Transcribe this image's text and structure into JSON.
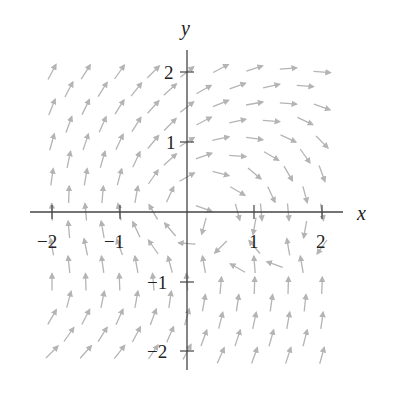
{
  "chart_data": {
    "type": "vector_field",
    "title": "",
    "xlabel": "x",
    "ylabel": "y",
    "xlim": [
      -2.3,
      2.3
    ],
    "ylim": [
      -2.3,
      2.3
    ],
    "grid": false,
    "x_ticks": [
      -2,
      -1,
      1,
      2
    ],
    "y_ticks": [
      -2,
      -1,
      1,
      2
    ],
    "x_tick_labels": [
      "−2",
      "−1",
      "1",
      "2"
    ],
    "y_tick_labels": [
      "−2",
      "−1",
      "1",
      "2"
    ],
    "arrow_color": "#b4b4b4",
    "axis_color": "#444444",
    "arrow_length_units": 0.24,
    "arrows_note": "each arrow: [x, y, direction_angle_degrees] (normalized direction field, staggered grid)",
    "arrows": [
      [
        -2.0,
        2.0,
        62
      ],
      [
        -1.5,
        2.0,
        58
      ],
      [
        -1.0,
        2.0,
        55
      ],
      [
        -0.5,
        2.0,
        45
      ],
      [
        0.0,
        2.0,
        38
      ],
      [
        -1.75,
        1.75,
        62
      ],
      [
        -1.25,
        1.75,
        58
      ],
      [
        -0.75,
        1.75,
        52
      ],
      [
        -0.25,
        1.75,
        42
      ],
      [
        0.25,
        1.75,
        30
      ],
      [
        0.75,
        1.8,
        20
      ],
      [
        1.25,
        1.8,
        12
      ],
      [
        1.75,
        1.8,
        -5
      ],
      [
        0.5,
        2.05,
        28
      ],
      [
        1.0,
        2.05,
        18
      ],
      [
        1.5,
        2.05,
        5
      ],
      [
        2.0,
        2.0,
        -5
      ],
      [
        -2.0,
        1.5,
        68
      ],
      [
        -1.5,
        1.5,
        64
      ],
      [
        -1.0,
        1.5,
        58
      ],
      [
        -0.5,
        1.5,
        48
      ],
      [
        0.0,
        1.5,
        38
      ],
      [
        0.5,
        1.55,
        22
      ],
      [
        1.0,
        1.55,
        10
      ],
      [
        1.5,
        1.55,
        -5
      ],
      [
        2.0,
        1.5,
        -20
      ],
      [
        -1.75,
        1.25,
        70
      ],
      [
        -1.25,
        1.25,
        66
      ],
      [
        -0.75,
        1.25,
        58
      ],
      [
        -0.25,
        1.25,
        45
      ],
      [
        0.25,
        1.3,
        28
      ],
      [
        0.75,
        1.3,
        12
      ],
      [
        1.25,
        1.3,
        -5
      ],
      [
        1.75,
        1.3,
        -25
      ],
      [
        -2.0,
        1.0,
        74
      ],
      [
        -1.5,
        1.0,
        72
      ],
      [
        -1.0,
        1.0,
        65
      ],
      [
        -0.5,
        1.0,
        50
      ],
      [
        0.0,
        1.0,
        32
      ],
      [
        0.5,
        1.05,
        12
      ],
      [
        1.0,
        1.05,
        -8
      ],
      [
        1.5,
        1.05,
        -25
      ],
      [
        2.0,
        1.0,
        -45
      ],
      [
        -1.75,
        0.75,
        78
      ],
      [
        -1.25,
        0.75,
        74
      ],
      [
        -0.75,
        0.75,
        65
      ],
      [
        -0.25,
        0.75,
        42
      ],
      [
        0.25,
        0.8,
        20
      ],
      [
        0.75,
        0.8,
        -5
      ],
      [
        1.25,
        0.8,
        -30
      ],
      [
        1.75,
        0.8,
        -55
      ],
      [
        -2.0,
        0.5,
        82
      ],
      [
        -1.5,
        0.5,
        80
      ],
      [
        -1.0,
        0.5,
        75
      ],
      [
        -0.5,
        0.5,
        55
      ],
      [
        0.0,
        0.5,
        30
      ],
      [
        0.5,
        0.55,
        -15
      ],
      [
        1.0,
        0.55,
        -40
      ],
      [
        1.5,
        0.55,
        -60
      ],
      [
        2.0,
        0.55,
        -70
      ],
      [
        -1.75,
        0.25,
        88
      ],
      [
        -1.25,
        0.25,
        85
      ],
      [
        -0.75,
        0.25,
        80
      ],
      [
        -0.25,
        0.25,
        65
      ],
      [
        0.75,
        0.3,
        -30
      ],
      [
        1.25,
        0.25,
        -65
      ],
      [
        1.75,
        0.25,
        -75
      ],
      [
        -2.0,
        0.0,
        92
      ],
      [
        -1.5,
        0.0,
        95
      ],
      [
        -1.0,
        0.0,
        100
      ],
      [
        -0.5,
        0.0,
        120
      ],
      [
        0.25,
        0.05,
        -20
      ],
      [
        0.75,
        0.0,
        -75
      ],
      [
        1.1,
        0.0,
        -85
      ],
      [
        1.5,
        0.0,
        -85
      ],
      [
        2.0,
        0.0,
        -80
      ],
      [
        -1.75,
        -0.25,
        95
      ],
      [
        -1.25,
        -0.25,
        100
      ],
      [
        -0.75,
        -0.25,
        115
      ],
      [
        -0.25,
        -0.25,
        130
      ],
      [
        0.25,
        -0.2,
        -105
      ],
      [
        1.0,
        -0.2,
        -100
      ],
      [
        1.75,
        -0.25,
        -100
      ],
      [
        -2.0,
        -0.5,
        100
      ],
      [
        -1.5,
        -0.5,
        102
      ],
      [
        -1.0,
        -0.5,
        110
      ],
      [
        -0.5,
        -0.5,
        125
      ],
      [
        0.0,
        -0.45,
        175
      ],
      [
        0.5,
        -0.5,
        -135
      ],
      [
        1.0,
        -0.5,
        130
      ],
      [
        1.5,
        -0.5,
        100
      ],
      [
        2.0,
        -0.5,
        -125
      ],
      [
        -1.75,
        -0.75,
        96
      ],
      [
        -1.25,
        -0.75,
        98
      ],
      [
        -0.75,
        -0.75,
        100
      ],
      [
        -0.25,
        -0.75,
        105
      ],
      [
        0.25,
        -0.75,
        100
      ],
      [
        0.75,
        -0.8,
        150
      ],
      [
        1.0,
        -0.75,
        95
      ],
      [
        1.3,
        -0.75,
        160
      ],
      [
        1.7,
        -0.75,
        100
      ],
      [
        -2.0,
        -1.0,
        90
      ],
      [
        -1.5,
        -1.0,
        92
      ],
      [
        -1.0,
        -1.0,
        92
      ],
      [
        -0.5,
        -1.0,
        95
      ],
      [
        0.0,
        -1.0,
        95
      ],
      [
        0.5,
        -1.05,
        85
      ],
      [
        1.0,
        -1.05,
        88
      ],
      [
        1.5,
        -1.05,
        88
      ],
      [
        2.0,
        -1.05,
        88
      ],
      [
        -1.75,
        -1.25,
        75
      ],
      [
        -1.25,
        -1.25,
        78
      ],
      [
        -0.75,
        -1.25,
        80
      ],
      [
        -0.25,
        -1.25,
        82
      ],
      [
        0.25,
        -1.3,
        80
      ],
      [
        0.75,
        -1.3,
        82
      ],
      [
        1.25,
        -1.3,
        82
      ],
      [
        1.75,
        -1.3,
        84
      ],
      [
        -2.0,
        -1.5,
        60
      ],
      [
        -1.5,
        -1.5,
        62
      ],
      [
        -1.0,
        -1.5,
        66
      ],
      [
        -0.5,
        -1.5,
        70
      ],
      [
        0.0,
        -1.5,
        74
      ],
      [
        0.5,
        -1.55,
        76
      ],
      [
        1.0,
        -1.55,
        78
      ],
      [
        1.5,
        -1.55,
        80
      ],
      [
        2.0,
        -1.55,
        82
      ],
      [
        -1.75,
        -1.75,
        55
      ],
      [
        -1.25,
        -1.75,
        58
      ],
      [
        -0.75,
        -1.75,
        62
      ],
      [
        -0.25,
        -1.75,
        66
      ],
      [
        0.25,
        -1.8,
        70
      ],
      [
        0.75,
        -1.8,
        72
      ],
      [
        1.25,
        -1.8,
        74
      ],
      [
        1.75,
        -1.8,
        76
      ],
      [
        -2.0,
        -2.0,
        45
      ],
      [
        -1.5,
        -2.0,
        48
      ],
      [
        -1.0,
        -2.0,
        52
      ],
      [
        -0.5,
        -2.0,
        56
      ],
      [
        0.0,
        -2.0,
        62
      ],
      [
        0.5,
        -2.05,
        66
      ],
      [
        1.0,
        -2.05,
        70
      ],
      [
        1.5,
        -2.05,
        72
      ],
      [
        2.0,
        -2.05,
        74
      ]
    ]
  },
  "labels": {
    "x_axis": "x",
    "y_axis": "y",
    "xt_m2": "−2",
    "xt_m1": "−1",
    "xt_1": "1",
    "xt_2": "2",
    "yt_2": "2",
    "yt_1": "1",
    "yt_m1": "−1",
    "yt_m2": "−2"
  }
}
